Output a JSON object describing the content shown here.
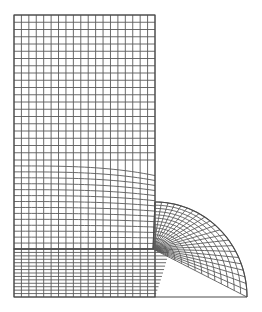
{
  "diagram": {
    "type": "finite-element-mesh",
    "line_color": "#5a5a5a",
    "border_color": "#4a4a4a",
    "background": "#ffffff",
    "upper_block": {
      "x0": 14,
      "x1": 155,
      "y0": 15,
      "y1": 249,
      "columns": 19,
      "coarse_rows": {
        "y0": 15,
        "y1": 160,
        "count": 20
      },
      "graded_rows": {
        "y0": 160,
        "y1": 249,
        "count": 15
      }
    },
    "lower_block": {
      "x0": 14,
      "x1": 155,
      "y0": 249,
      "y1": 297,
      "columns": 19,
      "rows": 14
    },
    "quarter_disc": {
      "center_x": 155,
      "center_y": 297,
      "radius_x": 92,
      "radius_y": 95,
      "focus_x": 153,
      "focus_y": 249,
      "radial_divisions": 22,
      "ring_divisions": 14
    }
  }
}
